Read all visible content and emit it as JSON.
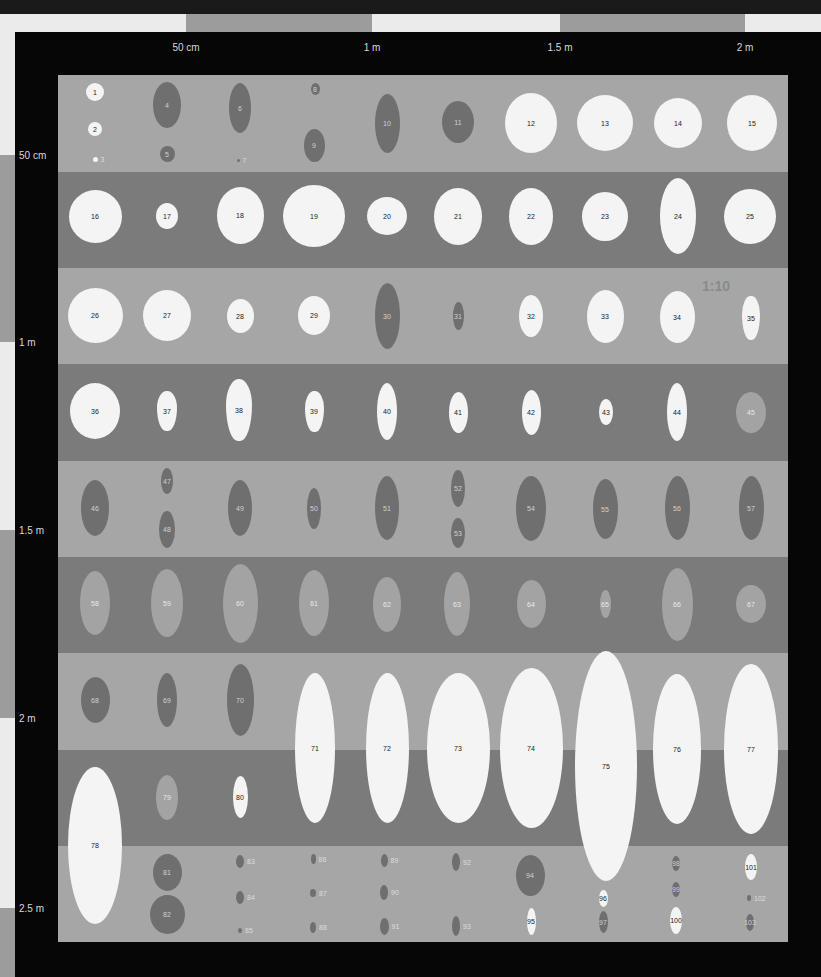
{
  "scale": {
    "top_labels": [
      {
        "text": "50 cm",
        "x": 186
      },
      {
        "text": "1 m",
        "x": 372
      },
      {
        "text": "1.5 m",
        "x": 560
      },
      {
        "text": "2 m",
        "x": 745
      }
    ],
    "left_labels": [
      {
        "text": "50 cm",
        "y": 155
      },
      {
        "text": "1 m",
        "y": 342
      },
      {
        "text": "1.5 m",
        "y": 530
      },
      {
        "text": "2 m",
        "y": 718
      },
      {
        "text": "2.5 m",
        "y": 908
      }
    ],
    "ratio": "1:10"
  },
  "bands": [
    "light",
    "dark",
    "light",
    "dark",
    "light",
    "dark",
    "light",
    "dark",
    "light"
  ],
  "items": [
    {
      "n": "1",
      "cx": 95,
      "cy": 92,
      "w": 18,
      "h": 18,
      "c": "w"
    },
    {
      "n": "2",
      "cx": 95,
      "cy": 129,
      "w": 14,
      "h": 14,
      "c": "w"
    },
    {
      "n": "3",
      "cx": 95,
      "cy": 159,
      "w": 5,
      "h": 5,
      "c": "w",
      "ext": true
    },
    {
      "n": "4",
      "cx": 167,
      "cy": 105,
      "w": 28,
      "h": 46,
      "c": "d"
    },
    {
      "n": "5",
      "cx": 167,
      "cy": 154,
      "w": 15,
      "h": 16,
      "c": "d"
    },
    {
      "n": "6",
      "cx": 240,
      "cy": 108,
      "w": 22,
      "h": 50,
      "c": "d"
    },
    {
      "n": "7",
      "cx": 238,
      "cy": 160,
      "w": 3,
      "h": 3,
      "c": "d",
      "ext": true
    },
    {
      "n": "8",
      "cx": 315,
      "cy": 89,
      "w": 9,
      "h": 12,
      "c": "d"
    },
    {
      "n": "9",
      "cx": 314,
      "cy": 145,
      "w": 21,
      "h": 33,
      "c": "d"
    },
    {
      "n": "10",
      "cx": 387,
      "cy": 123,
      "w": 25,
      "h": 59,
      "c": "d"
    },
    {
      "n": "11",
      "cx": 458,
      "cy": 122,
      "w": 32,
      "h": 42,
      "c": "d"
    },
    {
      "n": "12",
      "cx": 531,
      "cy": 123,
      "w": 52,
      "h": 60,
      "c": "w"
    },
    {
      "n": "13",
      "cx": 605,
      "cy": 123,
      "w": 56,
      "h": 56,
      "c": "w"
    },
    {
      "n": "14",
      "cx": 678,
      "cy": 123,
      "w": 48,
      "h": 50,
      "c": "w"
    },
    {
      "n": "15",
      "cx": 752,
      "cy": 123,
      "w": 50,
      "h": 56,
      "c": "w"
    },
    {
      "n": "16",
      "cx": 95,
      "cy": 216,
      "w": 53,
      "h": 53,
      "c": "w"
    },
    {
      "n": "17",
      "cx": 167,
      "cy": 216,
      "w": 22,
      "h": 26,
      "c": "w"
    },
    {
      "n": "18",
      "cx": 240,
      "cy": 215,
      "w": 47,
      "h": 57,
      "c": "w"
    },
    {
      "n": "19",
      "cx": 314,
      "cy": 216,
      "w": 62,
      "h": 62,
      "c": "w"
    },
    {
      "n": "20",
      "cx": 387,
      "cy": 216,
      "w": 40,
      "h": 38,
      "c": "w"
    },
    {
      "n": "21",
      "cx": 458,
      "cy": 216,
      "w": 48,
      "h": 57,
      "c": "w"
    },
    {
      "n": "22",
      "cx": 531,
      "cy": 216,
      "w": 44,
      "h": 57,
      "c": "w"
    },
    {
      "n": "23",
      "cx": 605,
      "cy": 216,
      "w": 46,
      "h": 49,
      "c": "w"
    },
    {
      "n": "24",
      "cx": 678,
      "cy": 216,
      "w": 36,
      "h": 76,
      "c": "w"
    },
    {
      "n": "25",
      "cx": 750,
      "cy": 216,
      "w": 52,
      "h": 55,
      "c": "w"
    },
    {
      "n": "26",
      "cx": 95,
      "cy": 315,
      "w": 55,
      "h": 55,
      "c": "w"
    },
    {
      "n": "27",
      "cx": 167,
      "cy": 315,
      "w": 48,
      "h": 51,
      "c": "w"
    },
    {
      "n": "28",
      "cx": 240,
      "cy": 316,
      "w": 27,
      "h": 34,
      "c": "w"
    },
    {
      "n": "29",
      "cx": 314,
      "cy": 315,
      "w": 32,
      "h": 39,
      "c": "w"
    },
    {
      "n": "30",
      "cx": 387,
      "cy": 316,
      "w": 25,
      "h": 66,
      "c": "d"
    },
    {
      "n": "31",
      "cx": 458,
      "cy": 316,
      "w": 11,
      "h": 28,
      "c": "d"
    },
    {
      "n": "32",
      "cx": 531,
      "cy": 316,
      "w": 24,
      "h": 42,
      "c": "w"
    },
    {
      "n": "33",
      "cx": 605,
      "cy": 316,
      "w": 37,
      "h": 53,
      "c": "w"
    },
    {
      "n": "34",
      "cx": 677,
      "cy": 317,
      "w": 35,
      "h": 52,
      "c": "w"
    },
    {
      "n": "35",
      "cx": 751,
      "cy": 318,
      "w": 18,
      "h": 44,
      "c": "w",
      "tear": true
    },
    {
      "n": "36",
      "cx": 95,
      "cy": 411,
      "w": 50,
      "h": 56,
      "c": "w"
    },
    {
      "n": "37",
      "cx": 167,
      "cy": 411,
      "w": 20,
      "h": 40,
      "c": "w",
      "tear": true
    },
    {
      "n": "38",
      "cx": 239,
      "cy": 410,
      "w": 26,
      "h": 62,
      "c": "w",
      "tear": true
    },
    {
      "n": "39",
      "cx": 314,
      "cy": 411,
      "w": 19,
      "h": 41,
      "c": "w",
      "tear": true
    },
    {
      "n": "40",
      "cx": 387,
      "cy": 411,
      "w": 20,
      "h": 57,
      "c": "w"
    },
    {
      "n": "41",
      "cx": 458,
      "cy": 412,
      "w": 19,
      "h": 41,
      "c": "w"
    },
    {
      "n": "42",
      "cx": 531,
      "cy": 412,
      "w": 19,
      "h": 45,
      "c": "w"
    },
    {
      "n": "43",
      "cx": 606,
      "cy": 412,
      "w": 14,
      "h": 26,
      "c": "w"
    },
    {
      "n": "44",
      "cx": 677,
      "cy": 412,
      "w": 20,
      "h": 58,
      "c": "w"
    },
    {
      "n": "45",
      "cx": 751,
      "cy": 412,
      "w": 30,
      "h": 41,
      "c": "m"
    },
    {
      "n": "46",
      "cx": 95,
      "cy": 508,
      "w": 28,
      "h": 56,
      "c": "d"
    },
    {
      "n": "47",
      "cx": 167,
      "cy": 481,
      "w": 12,
      "h": 26,
      "c": "d"
    },
    {
      "n": "48",
      "cx": 167,
      "cy": 529,
      "w": 16,
      "h": 37,
      "c": "d"
    },
    {
      "n": "49",
      "cx": 240,
      "cy": 508,
      "w": 24,
      "h": 56,
      "c": "d"
    },
    {
      "n": "50",
      "cx": 314,
      "cy": 508,
      "w": 14,
      "h": 41,
      "c": "d"
    },
    {
      "n": "51",
      "cx": 387,
      "cy": 508,
      "w": 24,
      "h": 64,
      "c": "d"
    },
    {
      "n": "52",
      "cx": 458,
      "cy": 488,
      "w": 14,
      "h": 37,
      "c": "d"
    },
    {
      "n": "53",
      "cx": 458,
      "cy": 533,
      "w": 14,
      "h": 30,
      "c": "d"
    },
    {
      "n": "54",
      "cx": 531,
      "cy": 508,
      "w": 30,
      "h": 65,
      "c": "d"
    },
    {
      "n": "55",
      "cx": 605,
      "cy": 509,
      "w": 25,
      "h": 60,
      "c": "d"
    },
    {
      "n": "56",
      "cx": 677,
      "cy": 508,
      "w": 25,
      "h": 64,
      "c": "d"
    },
    {
      "n": "57",
      "cx": 751,
      "cy": 508,
      "w": 25,
      "h": 64,
      "c": "d"
    },
    {
      "n": "58",
      "cx": 95,
      "cy": 603,
      "w": 30,
      "h": 64,
      "c": "m"
    },
    {
      "n": "59",
      "cx": 167,
      "cy": 603,
      "w": 32,
      "h": 68,
      "c": "m"
    },
    {
      "n": "60",
      "cx": 240,
      "cy": 603,
      "w": 35,
      "h": 79,
      "c": "m"
    },
    {
      "n": "61",
      "cx": 314,
      "cy": 603,
      "w": 30,
      "h": 66,
      "c": "m"
    },
    {
      "n": "62",
      "cx": 387,
      "cy": 604,
      "w": 28,
      "h": 55,
      "c": "m"
    },
    {
      "n": "63",
      "cx": 457,
      "cy": 604,
      "w": 26,
      "h": 64,
      "c": "m"
    },
    {
      "n": "64",
      "cx": 531,
      "cy": 604,
      "w": 29,
      "h": 48,
      "c": "m"
    },
    {
      "n": "65",
      "cx": 605,
      "cy": 604,
      "w": 11,
      "h": 28,
      "c": "m"
    },
    {
      "n": "66",
      "cx": 677,
      "cy": 604,
      "w": 31,
      "h": 73,
      "c": "m"
    },
    {
      "n": "67",
      "cx": 751,
      "cy": 604,
      "w": 30,
      "h": 38,
      "c": "m"
    },
    {
      "n": "68",
      "cx": 95,
      "cy": 700,
      "w": 29,
      "h": 46,
      "c": "d"
    },
    {
      "n": "69",
      "cx": 167,
      "cy": 700,
      "w": 20,
      "h": 54,
      "c": "d"
    },
    {
      "n": "70",
      "cx": 240,
      "cy": 700,
      "w": 27,
      "h": 72,
      "c": "d"
    },
    {
      "n": "71",
      "cx": 315,
      "cy": 748,
      "w": 40,
      "h": 150,
      "c": "w"
    },
    {
      "n": "72",
      "cx": 387,
      "cy": 748,
      "w": 43,
      "h": 150,
      "c": "w"
    },
    {
      "n": "73",
      "cx": 458,
      "cy": 748,
      "w": 63,
      "h": 150,
      "c": "w"
    },
    {
      "n": "74",
      "cx": 531,
      "cy": 748,
      "w": 63,
      "h": 160,
      "c": "w"
    },
    {
      "n": "75",
      "cx": 606,
      "cy": 766,
      "w": 62,
      "h": 230,
      "c": "w"
    },
    {
      "n": "76",
      "cx": 677,
      "cy": 749,
      "w": 48,
      "h": 150,
      "c": "w"
    },
    {
      "n": "77",
      "cx": 751,
      "cy": 749,
      "w": 54,
      "h": 170,
      "c": "w"
    },
    {
      "n": "78",
      "cx": 95,
      "cy": 845,
      "w": 54,
      "h": 157,
      "c": "w"
    },
    {
      "n": "79",
      "cx": 167,
      "cy": 797,
      "w": 22,
      "h": 45,
      "c": "m"
    },
    {
      "n": "80",
      "cx": 240,
      "cy": 797,
      "w": 15,
      "h": 42,
      "c": "w"
    },
    {
      "n": "81",
      "cx": 167,
      "cy": 872,
      "w": 29,
      "h": 37,
      "c": "d"
    },
    {
      "n": "82",
      "cx": 167,
      "cy": 914,
      "w": 35,
      "h": 39,
      "c": "d"
    },
    {
      "n": "83",
      "cx": 240,
      "cy": 861,
      "w": 8,
      "h": 13,
      "c": "d",
      "ext": true
    },
    {
      "n": "84",
      "cx": 240,
      "cy": 897,
      "w": 8,
      "h": 13,
      "c": "d",
      "ext": true
    },
    {
      "n": "85",
      "cx": 240,
      "cy": 930,
      "w": 4,
      "h": 5,
      "c": "d",
      "ext": true
    },
    {
      "n": "86",
      "cx": 313,
      "cy": 859,
      "w": 5,
      "h": 10,
      "c": "d",
      "ext": true
    },
    {
      "n": "87",
      "cx": 313,
      "cy": 893,
      "w": 6,
      "h": 8,
      "c": "d",
      "ext": true
    },
    {
      "n": "88",
      "cx": 313,
      "cy": 927,
      "w": 6,
      "h": 11,
      "c": "d",
      "ext": true
    },
    {
      "n": "89",
      "cx": 384,
      "cy": 860,
      "w": 7,
      "h": 13,
      "c": "d",
      "ext": true
    },
    {
      "n": "90",
      "cx": 384,
      "cy": 892,
      "w": 8,
      "h": 15,
      "c": "d",
      "ext": true
    },
    {
      "n": "91",
      "cx": 384,
      "cy": 926,
      "w": 9,
      "h": 17,
      "c": "d",
      "ext": true
    },
    {
      "n": "92",
      "cx": 456,
      "cy": 862,
      "w": 8,
      "h": 18,
      "c": "d",
      "ext": true
    },
    {
      "n": "93",
      "cx": 456,
      "cy": 926,
      "w": 8,
      "h": 20,
      "c": "d",
      "ext": true
    },
    {
      "n": "94",
      "cx": 530,
      "cy": 875,
      "w": 29,
      "h": 41,
      "c": "d"
    },
    {
      "n": "95",
      "cx": 531,
      "cy": 921,
      "w": 9,
      "h": 27,
      "c": "w"
    },
    {
      "n": "96",
      "cx": 603,
      "cy": 898,
      "w": 9,
      "h": 17,
      "c": "w"
    },
    {
      "n": "97",
      "cx": 603,
      "cy": 922,
      "w": 9,
      "h": 22,
      "c": "d"
    },
    {
      "n": "98",
      "cx": 676,
      "cy": 863,
      "w": 8,
      "h": 15,
      "c": "d"
    },
    {
      "n": "99",
      "cx": 676,
      "cy": 889,
      "w": 8,
      "h": 15,
      "c": "d"
    },
    {
      "n": "100",
      "cx": 676,
      "cy": 920,
      "w": 12,
      "h": 27,
      "c": "w"
    },
    {
      "n": "101",
      "cx": 751,
      "cy": 867,
      "w": 12,
      "h": 26,
      "c": "w"
    },
    {
      "n": "102",
      "cx": 749,
      "cy": 898,
      "w": 4,
      "h": 6,
      "c": "d",
      "ext": true
    },
    {
      "n": "103",
      "cx": 750,
      "cy": 922,
      "w": 8,
      "h": 17,
      "c": "d"
    }
  ]
}
